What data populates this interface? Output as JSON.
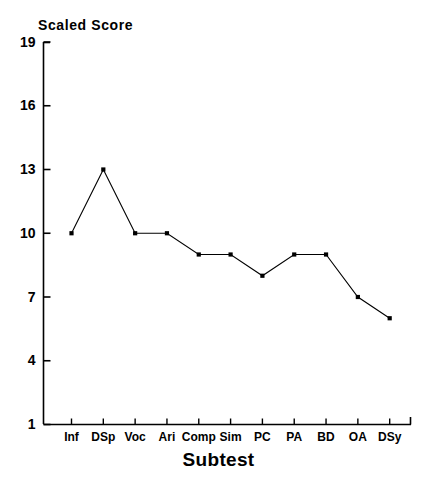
{
  "chart_data": {
    "type": "line",
    "title": "Scaled Score",
    "xlabel": "Subtest",
    "ylabel": "",
    "categories": [
      "Inf",
      "DSp",
      "Voc",
      "Ari",
      "Comp",
      "Sim",
      "PC",
      "PA",
      "BD",
      "OA",
      "DSy"
    ],
    "values": [
      10,
      13,
      10,
      10,
      9,
      9,
      8,
      9,
      9,
      7,
      6
    ],
    "ylim": [
      1,
      19
    ],
    "yticks": [
      1,
      4,
      7,
      10,
      13,
      16,
      19
    ],
    "grid": false,
    "legend": null,
    "marker": "square",
    "line_color": "#000000",
    "marker_color": "#000000",
    "background_color": "#ffffff"
  }
}
